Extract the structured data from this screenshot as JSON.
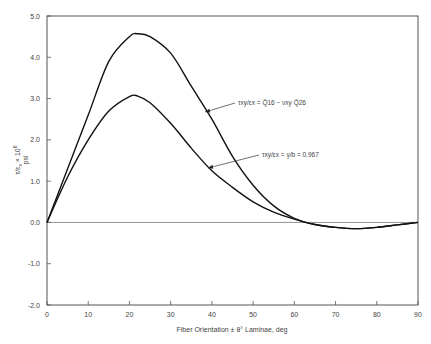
{
  "chart_data": {
    "type": "line",
    "title": "",
    "xlabel": "Fiber Orientation ± θ° Laminae, deg",
    "ylabel": "τ/εx × 10^6 psi",
    "xlim": [
      0,
      90
    ],
    "ylim": [
      -2.0,
      5.0
    ],
    "xticks": [
      0,
      10,
      20,
      30,
      40,
      50,
      60,
      70,
      80,
      90
    ],
    "xtick_labels": [
      "0",
      "10",
      "20",
      "30",
      "40",
      "50",
      "60",
      "70",
      "80",
      "90"
    ],
    "yticks": [
      -2.0,
      -1.0,
      0.0,
      1.0,
      2.0,
      3.0,
      4.0,
      5.0
    ],
    "ytick_labels": [
      "-2.0",
      "-1.0",
      "0.0",
      "1.0",
      "2.0",
      "3.0",
      "4.0",
      "5.0"
    ],
    "grid": false,
    "zero_line": true,
    "x": [
      0,
      5,
      10,
      15,
      20,
      22,
      25,
      30,
      35,
      40,
      45,
      50,
      55,
      60,
      65,
      70,
      75,
      80,
      85,
      90
    ],
    "series": [
      {
        "name": "τxy/εx = Q̄16 − νxy Q̄26",
        "values": [
          0,
          1.3,
          2.6,
          3.9,
          4.5,
          4.57,
          4.5,
          4.1,
          3.3,
          2.5,
          1.6,
          0.9,
          0.4,
          0.1,
          -0.05,
          -0.12,
          -0.15,
          -0.12,
          -0.06,
          0
        ]
      },
      {
        "name": "τxy/εx ; γ/b = 0.967",
        "values": [
          0,
          1.1,
          2.0,
          2.7,
          3.05,
          3.06,
          2.9,
          2.4,
          1.8,
          1.25,
          0.85,
          0.5,
          0.25,
          0.08,
          -0.05,
          -0.12,
          -0.15,
          -0.12,
          -0.06,
          0
        ]
      }
    ],
    "annotations": [
      {
        "text_main": "τxy/εx",
        "text_rest": " = Q̄16 − νxy Q̄26",
        "label_x": 238,
        "label_y": 105,
        "arrow_to": [
          205,
          112
        ]
      },
      {
        "text_main": "τxy/εx",
        "text_rest": " =  γ/b = 0.967",
        "label_x": 262,
        "label_y": 157,
        "arrow_to": [
          208,
          168
        ]
      }
    ]
  }
}
